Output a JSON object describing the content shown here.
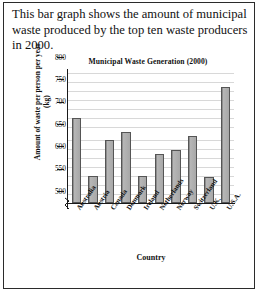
{
  "caption": "This bar graph shows the amount of municipal waste produced by the top ten waste producers in 2000.",
  "chart_data": {
    "type": "bar",
    "title": "Municipal Waste Generation (2000)",
    "xlabel": "Country",
    "ylabel": "Amount of waste per person per year (kg)",
    "categories": [
      "Australia",
      "Austria",
      "Canada",
      "Denmark",
      "Ireland",
      "Netherlands",
      "Norway",
      "Switzerland",
      "U.K.",
      "U.S.A."
    ],
    "values": [
      690,
      560,
      640,
      658,
      560,
      610,
      618,
      650,
      558,
      760
    ],
    "ylim": [
      500,
      800
    ],
    "yticks": [
      500,
      550,
      600,
      650,
      700,
      750,
      800
    ],
    "ytick_labels": [
      "500",
      "550",
      "600",
      "650",
      "700",
      "750",
      "800"
    ],
    "axis_break": true,
    "grid": true,
    "legend": "none",
    "bar_color": "#a8a8a8",
    "bar_edge_color": "#555555"
  }
}
